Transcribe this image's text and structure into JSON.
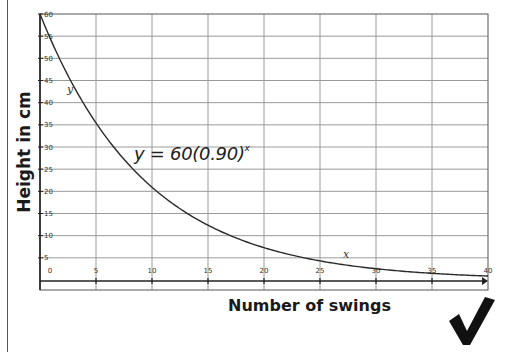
{
  "chart_data": {
    "type": "line",
    "title": "",
    "xlabel": "Number of swings",
    "ylabel": "Height in cm",
    "xlim": [
      0,
      40
    ],
    "ylim": [
      0,
      60
    ],
    "x_ticks": [
      0,
      5,
      10,
      15,
      20,
      25,
      30,
      35,
      40
    ],
    "y_ticks": [
      5,
      10,
      15,
      20,
      25,
      30,
      35,
      40,
      45,
      50,
      55,
      60
    ],
    "grid": true,
    "series": [
      {
        "name": "y = 60(0.90)^x",
        "function": {
          "a": 60,
          "b": 0.9
        },
        "x": [
          0,
          5,
          10,
          15,
          20,
          25,
          30,
          35,
          40
        ],
        "values": [
          60,
          35.4,
          20.9,
          12.4,
          7.3,
          4.3,
          2.5,
          1.5,
          0.9
        ]
      }
    ],
    "annotations": {
      "equation_main": "y = 60(0.90)",
      "equation_exponent": "x",
      "curve_label_y": "y",
      "curve_label_x": "x"
    }
  },
  "colors": {
    "grid": "#9a9a9a",
    "axis": "#222222",
    "curve": "#2a2a2a",
    "check": "#111111"
  },
  "checkmark": "correct-check-mark"
}
